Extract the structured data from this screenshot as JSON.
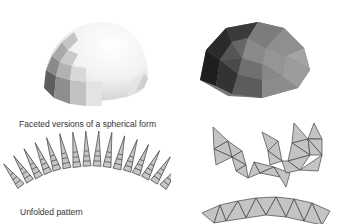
{
  "figure": {
    "captions": {
      "faceted": "Faceted versions of a spherical form",
      "unfolded": "Unfolded pattern"
    },
    "panels": [
      {
        "id": "light-dome",
        "description": "Faceted hemisphere, light shading, quad facets"
      },
      {
        "id": "dark-dome",
        "description": "Faceted hemisphere, dark shading, triangular geodesic facets"
      },
      {
        "id": "gore-pattern",
        "description": "Unfolded gore pattern of spikes along an arc",
        "spike_count": 16
      },
      {
        "id": "triangle-net",
        "description": "Unfolded triangular net pattern"
      }
    ],
    "colors": {
      "background": "#ffffff",
      "net_fill": "#c4c4c4",
      "net_stroke": "#444444",
      "text": "#333333"
    }
  }
}
